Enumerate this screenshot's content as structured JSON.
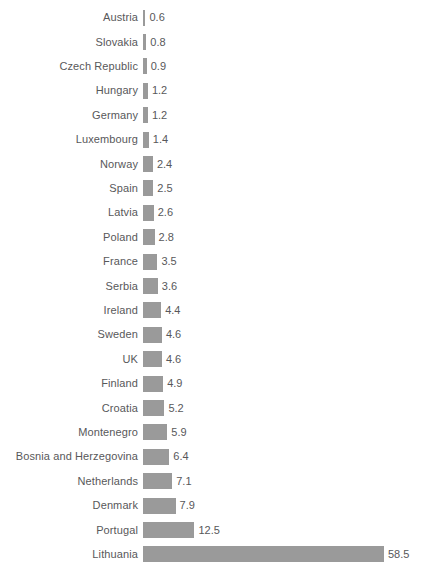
{
  "chart_data": {
    "type": "bar",
    "orientation": "horizontal",
    "title": "",
    "subtitle": "",
    "xlabel": "",
    "ylabel": "",
    "grid": false,
    "legend": false,
    "axis_visible": false,
    "value_labels": true,
    "sorted": "ascending",
    "xlim": [
      0,
      58.5
    ],
    "categories": [
      "Austria",
      "Slovakia",
      "Czech Republic",
      "Hungary",
      "Germany",
      "Luxembourg",
      "Norway",
      "Spain",
      "Latvia",
      "Poland",
      "France",
      "Serbia",
      "Ireland",
      "Sweden",
      "UK",
      "Finland",
      "Croatia",
      "Montenegro",
      "Bosnia and Herzegovina",
      "Netherlands",
      "Denmark",
      "Portugal",
      "Lithuania"
    ],
    "values": [
      0.6,
      0.8,
      0.9,
      1.2,
      1.2,
      1.4,
      2.4,
      2.5,
      2.6,
      2.8,
      3.5,
      3.6,
      4.4,
      4.6,
      4.6,
      4.9,
      5.2,
      5.9,
      6.4,
      7.1,
      7.9,
      12.5,
      58.5
    ],
    "value_text": [
      "0.6",
      "0.8",
      "0.9",
      "1.2",
      "1.2",
      "1.4",
      "2.4",
      "2.5",
      "2.6",
      "2.8",
      "3.5",
      "3.6",
      "4.4",
      "4.6",
      "4.6",
      "4.9",
      "5.2",
      "5.9",
      "6.4",
      "7.1",
      "7.9",
      "12.5",
      "58.5"
    ]
  },
  "style": {
    "bar_color": "#9a9a9a",
    "text_color": "#58585a",
    "background": "#ffffff"
  }
}
